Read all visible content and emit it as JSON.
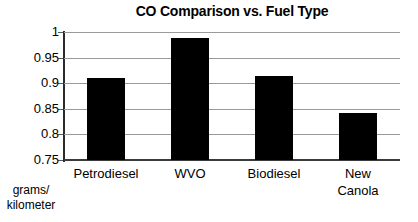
{
  "chart_data": {
    "type": "bar",
    "title": "CO Comparison vs. Fuel Type",
    "categories": [
      "Petrodiesel",
      "WVO",
      "Biodiesel",
      "New\nCanola"
    ],
    "values": [
      0.911,
      0.988,
      0.914,
      0.842
    ],
    "xlabel": "",
    "ylabel": "grams/\nkilometer",
    "ylim": [
      0.75,
      1
    ],
    "yticks": [
      1,
      0.95,
      0.9,
      0.85,
      0.8,
      0.75
    ],
    "ytick_labels": [
      "1",
      "0.95",
      "0.9",
      "0.85",
      "0.8",
      "0.75"
    ],
    "grid": true,
    "legend": false,
    "bar_color": "#000000",
    "grid_color": "#9a9a9a",
    "axis_color": "#2b2b2b",
    "background": "#ffffff"
  }
}
